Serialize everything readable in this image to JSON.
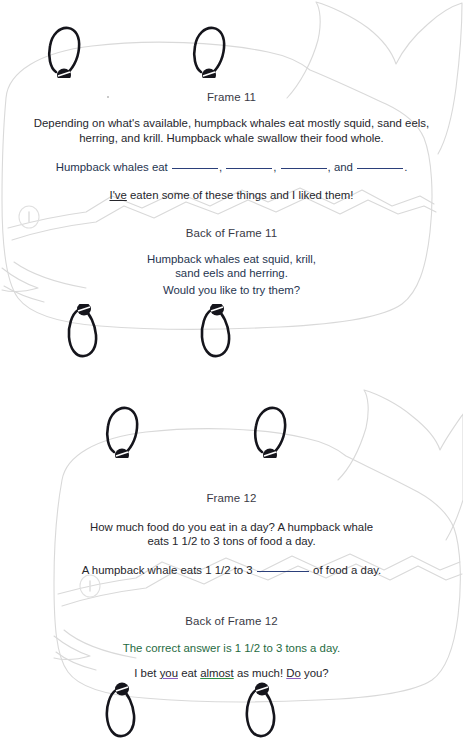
{
  "document": {
    "kind": "scanned-worksheet",
    "background_color": "#ffffff",
    "outline_color": "#d7d7d7"
  },
  "cards": [
    {
      "id": "frame-11",
      "title": "Frame 11",
      "front": {
        "paragraph": "Depending on what's available, humpback whales eat mostly squid, sand eels, herring, and krill. Humpback whale swallow their food whole.",
        "fill_in": {
          "prefix": "Humpback whales eat",
          "separator": ",",
          "conjunction": "and",
          "terminator": ".",
          "blank_count": 4,
          "blank_color": "#2b3f7a"
        },
        "note_prefix": "I've",
        "note_rest": " eaten some of these things and I liked them!"
      },
      "back": {
        "title": "Back of Frame 11",
        "answer_line_1": "Humpback whales eat squid, krill,",
        "answer_line_2": "sand eels and herring.",
        "prompt": "Would you like to try them?"
      }
    },
    {
      "id": "frame-12",
      "title": "Frame 12",
      "front": {
        "paragraph_line_1": "How much food do you eat in a day? A humpback whale",
        "paragraph_line_2": "eats 1 1/2 to 3 tons of food a day.",
        "fill_in": {
          "prefix": "A humpback whale eats 1 1/2 to 3",
          "suffix": "of food a day.",
          "blank_count": 1,
          "blank_color": "#2b3f7a"
        }
      },
      "back": {
        "title": "Back of Frame 12",
        "answer": "The correct answer is 1 1/2 to 3 tons a day.",
        "closing": {
          "part_1": "I bet ",
          "word_you": "you",
          "part_2": " eat ",
          "word_almost": "almost",
          "part_3": " as much! ",
          "word_do": "Do",
          "part_4": " you?"
        }
      }
    }
  ],
  "decoration": {
    "binding_ring_label": "spiral-binding-ring",
    "whale_label": "whale-outline-watermark",
    "eye_label": "whale-eye"
  }
}
